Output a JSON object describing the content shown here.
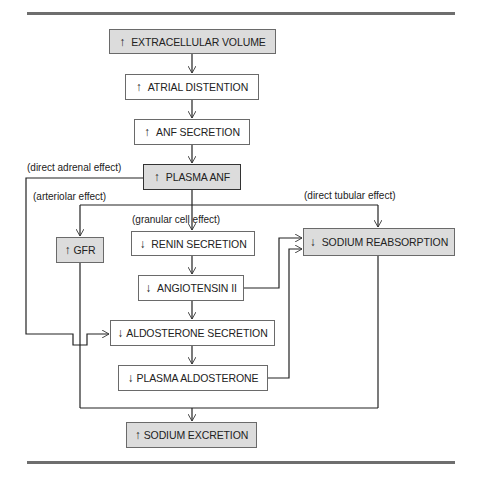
{
  "diagram": {
    "nodes": [
      {
        "id": "extracellular-volume",
        "direction": "↑",
        "label": "EXTRACELLULAR VOLUME",
        "shaded": true
      },
      {
        "id": "atrial-distention",
        "direction": "↑",
        "label": "ATRIAL DISTENTION",
        "shaded": false
      },
      {
        "id": "anf-secretion",
        "direction": "↑",
        "label": "ANF SECRETION",
        "shaded": false
      },
      {
        "id": "plasma-anf",
        "direction": "↑",
        "label": "PLASMA ANF",
        "shaded": true
      },
      {
        "id": "gfr",
        "direction": "↑",
        "label": "GFR",
        "shaded": true
      },
      {
        "id": "renin-secretion",
        "direction": "↓",
        "label": "RENIN SECRETION",
        "shaded": false
      },
      {
        "id": "angiotensin-ii",
        "direction": "↓",
        "label": "ANGIOTENSIN II",
        "shaded": false
      },
      {
        "id": "aldosterone-secretion",
        "direction": "↓",
        "label": "ALDOSTERONE SECRETION",
        "shaded": false
      },
      {
        "id": "plasma-aldosterone",
        "direction": "↓",
        "label": "PLASMA ALDOSTERONE",
        "shaded": false
      },
      {
        "id": "sodium-reabsorption",
        "direction": "↓",
        "label": "SODIUM REABSORPTION",
        "shaded": true
      },
      {
        "id": "sodium-excretion",
        "direction": "↑",
        "label": "SODIUM EXCRETION",
        "shaded": true
      }
    ],
    "edge_labels": {
      "direct_adrenal": "(direct adrenal effect)",
      "arteriolar": "(arteriolar effect)",
      "direct_tubular": "(direct tubular effect)",
      "granular_cell": "(granular cell effect)"
    },
    "edges": [
      {
        "from": "extracellular-volume",
        "to": "atrial-distention"
      },
      {
        "from": "atrial-distention",
        "to": "anf-secretion"
      },
      {
        "from": "anf-secretion",
        "to": "plasma-anf"
      },
      {
        "from": "plasma-anf",
        "to": "aldosterone-secretion",
        "label": "(direct adrenal effect)"
      },
      {
        "from": "plasma-anf",
        "to": "gfr",
        "label": "(arteriolar effect)"
      },
      {
        "from": "plasma-anf",
        "to": "sodium-reabsorption",
        "label": "(direct tubular effect)"
      },
      {
        "from": "plasma-anf",
        "to": "renin-secretion",
        "label": "(granular cell effect)"
      },
      {
        "from": "renin-secretion",
        "to": "angiotensin-ii"
      },
      {
        "from": "angiotensin-ii",
        "to": "aldosterone-secretion"
      },
      {
        "from": "angiotensin-ii",
        "to": "sodium-reabsorption"
      },
      {
        "from": "aldosterone-secretion",
        "to": "plasma-aldosterone"
      },
      {
        "from": "plasma-aldosterone",
        "to": "sodium-reabsorption"
      },
      {
        "from": "gfr",
        "to": "sodium-excretion"
      },
      {
        "from": "sodium-reabsorption",
        "to": "sodium-excretion"
      }
    ]
  },
  "colors": {
    "shaded_fill": "#dcdcdc",
    "rule": "#6e6e6e",
    "line": "#222222"
  }
}
